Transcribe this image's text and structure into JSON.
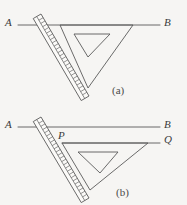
{
  "page": {
    "background_color": "#f6f5f3",
    "ink_color": "#5a5a5a",
    "width": 187,
    "height": 205
  },
  "figures": [
    {
      "id": "figure-a",
      "caption": "(a)",
      "caption_pos": {
        "x": 112,
        "y": 84
      },
      "lines": [
        {
          "name": "line-AB",
          "label_left": "A",
          "label_right": "B",
          "x1": 18,
          "y1": 25,
          "x2": 160,
          "y2": 25,
          "label_left_pos": {
            "x": 5,
            "y": 17
          },
          "label_right_pos": {
            "x": 164,
            "y": 17
          }
        }
      ],
      "ruler": {
        "name": "ruler",
        "x1": 41,
        "y1": 14,
        "x2": 89,
        "y2": 96,
        "width": 9,
        "tick_count": 23
      },
      "set_square": {
        "name": "set-square",
        "outer": [
          [
            60,
            25
          ],
          [
            133,
            25
          ],
          [
            88,
            88
          ]
        ],
        "inner": [
          [
            74,
            34
          ],
          [
            110,
            34
          ],
          [
            88,
            57
          ]
        ]
      }
    },
    {
      "id": "figure-b",
      "caption": "(b)",
      "caption_pos": {
        "x": 116,
        "y": 186
      },
      "lines": [
        {
          "name": "line-AB",
          "label_left": "A",
          "label_right": "B",
          "x1": 18,
          "y1": 127,
          "x2": 160,
          "y2": 127,
          "label_left_pos": {
            "x": 5,
            "y": 119
          },
          "label_right_pos": {
            "x": 164,
            "y": 119
          }
        },
        {
          "name": "line-PQ",
          "label_left": "P",
          "label_right": "Q",
          "x1": 62,
          "y1": 143,
          "x2": 160,
          "y2": 143,
          "label_left_pos": {
            "x": 58,
            "y": 130
          },
          "label_right_pos": {
            "x": 164,
            "y": 134
          }
        }
      ],
      "ruler": {
        "name": "ruler",
        "x1": 41,
        "y1": 117,
        "x2": 89,
        "y2": 198,
        "width": 9,
        "tick_count": 23
      },
      "set_square": {
        "name": "set-square",
        "outer": [
          [
            62,
            143
          ],
          [
            148,
            143
          ],
          [
            90,
            190
          ]
        ],
        "inner": [
          [
            78,
            152
          ],
          [
            118,
            152
          ],
          [
            100,
            173
          ]
        ]
      }
    }
  ]
}
